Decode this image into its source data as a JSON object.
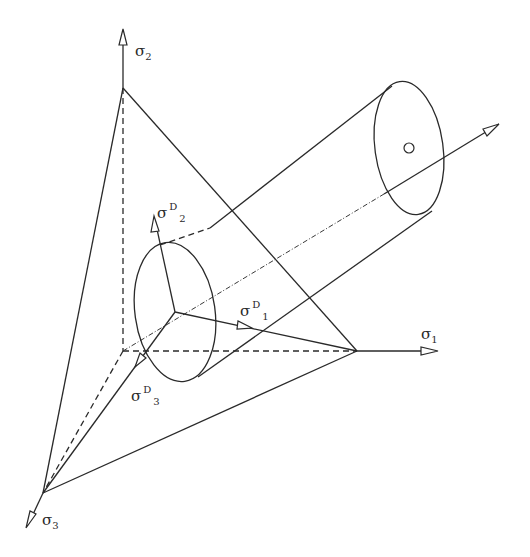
{
  "diagram": {
    "type": "stress-space-cylinder",
    "colors": {
      "line": "#2a2a2a",
      "background": "#ffffff"
    },
    "axes": [
      {
        "id": "sigma1",
        "symbol": "σ",
        "subscript": "1"
      },
      {
        "id": "sigma2",
        "symbol": "σ",
        "subscript": "2"
      },
      {
        "id": "sigma3",
        "symbol": "σ",
        "subscript": "3"
      }
    ],
    "deviatoric_vectors": [
      {
        "id": "sigmaD1",
        "symbol": "σ",
        "superscript": "D",
        "subscript": "1"
      },
      {
        "id": "sigmaD2",
        "symbol": "σ",
        "superscript": "D",
        "subscript": "2"
      },
      {
        "id": "sigmaD3",
        "symbol": "σ",
        "superscript": "D",
        "subscript": "3"
      }
    ]
  }
}
